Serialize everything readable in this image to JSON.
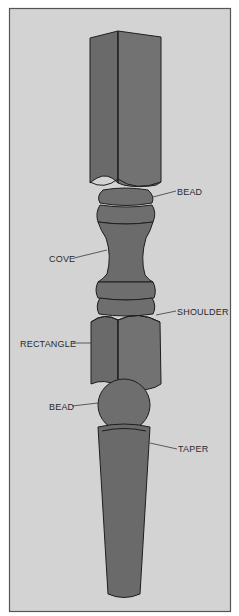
{
  "figure": {
    "colors": {
      "background": "#ffffff",
      "panel": "#d3d3d3",
      "panel_border": "#555555",
      "part_fill": "#6e6e6e",
      "part_fill_dark": "#626262",
      "outline": "#1e1e1e",
      "text": "#2a2a2a"
    },
    "labels": [
      {
        "id": "bead-top",
        "text": "BEAD",
        "side": "right"
      },
      {
        "id": "cove",
        "text": "COVE",
        "side": "left"
      },
      {
        "id": "shoulder",
        "text": "SHOULDER",
        "side": "right"
      },
      {
        "id": "rectangle",
        "text": "RECTANGLE",
        "side": "left"
      },
      {
        "id": "bead-bottom",
        "text": "BEAD",
        "side": "left"
      },
      {
        "id": "taper",
        "text": "TAPER",
        "side": "right"
      }
    ]
  }
}
